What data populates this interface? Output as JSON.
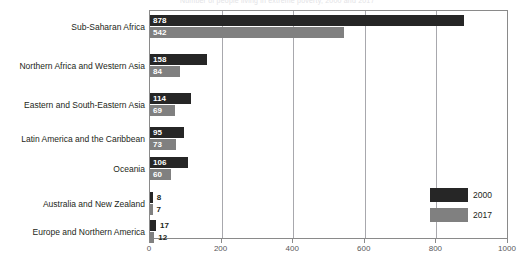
{
  "top_cut_text": "Number of people living in extreme poverty, 2000 and 2017",
  "chart_data": {
    "type": "bar",
    "orientation": "horizontal",
    "title": "",
    "subtitle": "",
    "xlabel": "",
    "ylabel": "",
    "xlim": [
      0,
      1000
    ],
    "xticks": [
      0,
      200,
      400,
      600,
      800,
      1000
    ],
    "xtick_labels": [
      "0",
      "200",
      "400",
      "600",
      "800",
      "1000"
    ],
    "grid": "vertical",
    "legend_position": "bottom-right",
    "categories": [
      "Sub-Saharan Africa",
      "Northern Africa and Western Asia",
      "Eastern and South-Eastern Asia",
      "Latin America and the Caribbean",
      "Oceania",
      "Australia and New Zealand",
      "Europe and Northern America"
    ],
    "series": [
      {
        "name": "2000",
        "color": "#262626",
        "values": [
          878,
          158,
          114,
          95,
          106,
          8,
          17
        ]
      },
      {
        "name": "2017",
        "color": "#808080",
        "values": [
          542,
          84,
          69,
          73,
          60,
          7,
          12
        ]
      }
    ],
    "legend": [
      {
        "label": "2000",
        "color": "#262626"
      },
      {
        "label": "2017",
        "color": "#808080"
      }
    ]
  },
  "colors": {
    "series_2000": "#262626",
    "series_2017": "#808080",
    "axis": "#8a8a8a",
    "gridline": "#a8a8ad",
    "text": "#231f20",
    "tick_text": "#58585b",
    "background": "#ffffff"
  }
}
